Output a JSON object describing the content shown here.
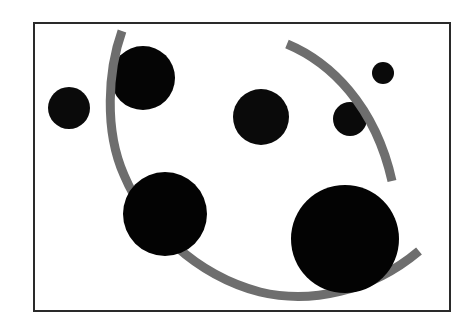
{
  "figure": {
    "width": 466,
    "height": 333,
    "background": "#ffffff",
    "frame": {
      "x": 34,
      "y": 23,
      "width": 416,
      "height": 288,
      "stroke": "#2a2a2a",
      "stroke_width": 2
    },
    "arc": {
      "stroke": "#6e6e6e",
      "stroke_width": 9,
      "segments": [
        {
          "name": "arc-main",
          "d": "M 122 31 C 108 70, 104 130, 124 175 C 145 225, 195 275, 260 292 C 310 304, 370 292, 419 251"
        },
        {
          "name": "arc-upper-right",
          "d": "M 287 44 C 330 62, 375 105, 392 181"
        }
      ]
    },
    "circles_behind_arc": [
      {
        "name": "circle-upper-left-large",
        "cx": 143,
        "cy": 78,
        "r": 32,
        "fill": "#050505"
      },
      {
        "name": "circle-left-small",
        "cx": 69,
        "cy": 108,
        "r": 21,
        "fill": "#0a0a0a"
      },
      {
        "name": "circle-middle",
        "cx": 261,
        "cy": 117,
        "r": 28,
        "fill": "#0a0a0a"
      },
      {
        "name": "circle-right-small",
        "cx": 350,
        "cy": 119,
        "r": 17,
        "fill": "#0a0a0a"
      },
      {
        "name": "circle-top-right-tiny",
        "cx": 383,
        "cy": 73,
        "r": 11,
        "fill": "#0a0a0a"
      }
    ],
    "circles_over_arc": [
      {
        "name": "circle-lower-left-large",
        "cx": 165,
        "cy": 214,
        "r": 42,
        "fill": "#030303"
      },
      {
        "name": "circle-lower-right-largest",
        "cx": 345,
        "cy": 239,
        "r": 54,
        "fill": "#030303"
      }
    ]
  }
}
